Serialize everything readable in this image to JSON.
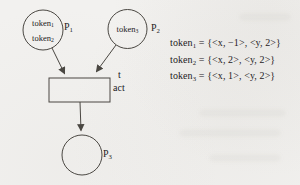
{
  "figure": "petri-net-token-diagram",
  "colors": {
    "paper": "#f2f1ef",
    "ink": "#4a4742",
    "text": "#24211d"
  },
  "diagram": {
    "p1": {
      "label": {
        "base": "P",
        "sub": "1"
      },
      "token1": {
        "base": "token",
        "sub": "1"
      },
      "token2": {
        "base": "token",
        "sub": "2"
      }
    },
    "p2": {
      "label": {
        "base": "P",
        "sub": "2"
      },
      "token1": {
        "base": "token",
        "sub": "3"
      }
    },
    "p3": {
      "label": {
        "base": "P",
        "sub": "3"
      }
    },
    "transition": {
      "name": "t",
      "action": "act"
    }
  },
  "equations": [
    {
      "lhs_base": "token",
      "lhs_sub": "1",
      "rhs": " = {<x, −1>, <y, 2>}"
    },
    {
      "lhs_base": "token",
      "lhs_sub": "2",
      "rhs": " = {<x, 2>, <y, 2>}"
    },
    {
      "lhs_base": "token",
      "lhs_sub": "3",
      "rhs": " = {<x, 1>, <y, 2>}"
    }
  ]
}
